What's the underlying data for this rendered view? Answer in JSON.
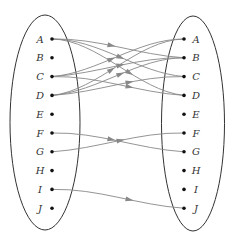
{
  "diagram": {
    "type": "mapping-diagram",
    "left_set": {
      "elements": [
        "A",
        "B",
        "C",
        "D",
        "E",
        "F",
        "G",
        "H",
        "I",
        "J"
      ]
    },
    "right_set": {
      "elements": [
        "A",
        "B",
        "C",
        "D",
        "E",
        "F",
        "G",
        "H",
        "I",
        "J"
      ]
    },
    "mappings": [
      {
        "from": "A",
        "to": "B"
      },
      {
        "from": "A",
        "to": "C"
      },
      {
        "from": "A",
        "to": "D"
      },
      {
        "from": "C",
        "to": "A"
      },
      {
        "from": "C",
        "to": "B"
      },
      {
        "from": "C",
        "to": "D"
      },
      {
        "from": "D",
        "to": "A"
      },
      {
        "from": "D",
        "to": "B"
      },
      {
        "from": "D",
        "to": "C"
      },
      {
        "from": "F",
        "to": "G"
      },
      {
        "from": "G",
        "to": "F"
      },
      {
        "from": "I",
        "to": "J"
      }
    ],
    "colors": {
      "ellipse": "#333333",
      "edge": "#888888",
      "dot": "#111111"
    }
  }
}
